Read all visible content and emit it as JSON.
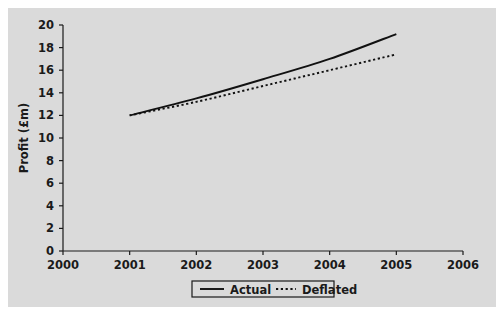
{
  "figure": {
    "background_color": "#ffffff",
    "panel_color": "#dadada",
    "ink_color": "#1a1a1a"
  },
  "chart_data": {
    "type": "line",
    "title": "",
    "xlabel": "",
    "ylabel": "Profit (£m)",
    "xlim": [
      2000,
      2006
    ],
    "ylim": [
      0,
      20
    ],
    "grid": false,
    "legend_position": "bottom-center",
    "x": [
      2001,
      2002,
      2003,
      2004,
      2005
    ],
    "xticks": [
      "2000",
      "2001",
      "2002",
      "2003",
      "2004",
      "2005",
      "2006"
    ],
    "yticks": [
      "0",
      "2",
      "4",
      "6",
      "8",
      "10",
      "12",
      "14",
      "16",
      "18",
      "20"
    ],
    "series": [
      {
        "name": "Actual",
        "style": "solid",
        "color": "#111111",
        "values": [
          12.0,
          13.5,
          15.2,
          17.0,
          19.2
        ]
      },
      {
        "name": "Deflated",
        "style": "dotted",
        "color": "#111111",
        "values": [
          12.0,
          13.2,
          14.6,
          16.0,
          17.4
        ]
      }
    ],
    "legend": [
      {
        "label": "Actual",
        "style": "solid"
      },
      {
        "label": "Deflated",
        "style": "dotted"
      }
    ]
  }
}
